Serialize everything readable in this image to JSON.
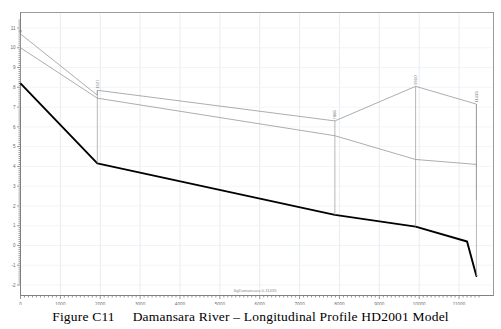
{
  "caption": {
    "figure_number": "Figure C11",
    "gap": "     ",
    "title": "Damansara River – Longitudinal Profile HD2001 Model",
    "full": "Figure C11     Damansara River – Longitudinal Profile HD2001 Model"
  },
  "chart_data": {
    "type": "line",
    "title": "Damansara River – Longitudinal Profile HD2001 Model",
    "xlabel": "SgDamansara 0-11435",
    "ylabel": "",
    "xlim": [
      0,
      11500
    ],
    "ylim": [
      -2,
      11.4
    ],
    "xticks": [
      0,
      1000,
      2000,
      3000,
      4000,
      5000,
      6000,
      7000,
      8000,
      9000,
      10000,
      11000
    ],
    "xtick_labels": [
      "0",
      "1000",
      "2000",
      "3000",
      "4000",
      "5000",
      "6000",
      "7000",
      "8000",
      "9000",
      "10000",
      "11000"
    ],
    "yticks": [
      -2,
      -1,
      0,
      1,
      2,
      3,
      4,
      5,
      6,
      7,
      8,
      9,
      10,
      11
    ],
    "ytick_labels": [
      "-2",
      "-1",
      "0",
      "1",
      "2",
      "3",
      "4",
      "5",
      "6",
      "7",
      "8",
      "9",
      "10",
      "11"
    ],
    "grid": true,
    "legend_position": "none",
    "annotations": [
      {
        "label": "0",
        "x": 0,
        "color": "#999999"
      },
      {
        "label": "1927",
        "x": 1927,
        "color": "#999999"
      },
      {
        "label": "7885",
        "x": 7885,
        "color": "#999999"
      },
      {
        "label": "9910",
        "x": 9910,
        "color": "#999999"
      },
      {
        "label": "11435",
        "x": 11435,
        "color": "#999999"
      }
    ],
    "series": [
      {
        "name": "Left bank top",
        "color": "#8a8a8a",
        "width": 0.7,
        "x": [
          0,
          1927,
          1927,
          7885,
          9910,
          11435,
          11435
        ],
        "y": [
          10.7,
          7.6,
          7.85,
          6.3,
          8.05,
          7.15,
          4.0
        ]
      },
      {
        "name": "Right bank top",
        "color": "#8a8a8a",
        "width": 0.7,
        "x": [
          0,
          1927,
          7885,
          9910,
          11435,
          11435
        ],
        "y": [
          10.0,
          7.45,
          5.55,
          4.35,
          4.1,
          2.3
        ]
      },
      {
        "name": "Bed level",
        "color": "#000000",
        "width": 1.9,
        "x": [
          0,
          1927,
          7885,
          9910,
          11200,
          11435
        ],
        "y": [
          8.2,
          4.15,
          1.55,
          0.95,
          0.2,
          -1.55
        ]
      }
    ]
  }
}
